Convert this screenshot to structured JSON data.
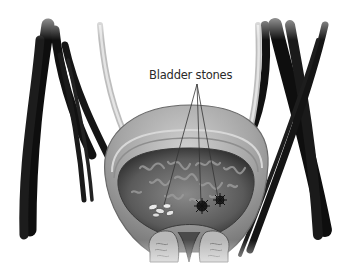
{
  "figure": {
    "annotations": [
      {
        "id": "bladder-stones",
        "text": "Bladder stones",
        "pointer_count": 3
      }
    ],
    "colors": {
      "background": "#ffffff",
      "tube_dark": "#111111",
      "tube_light": "#d4d4d4",
      "bladder_wall": "#a8a8a8",
      "bladder_inner": "#4a4a4a",
      "mucosa": "#7c7c7c",
      "stone_light": "#e8e8e8",
      "stone_dark": "#1a1a1a",
      "pointer_line": "#333333",
      "label_text": "#2a2a2a"
    }
  }
}
